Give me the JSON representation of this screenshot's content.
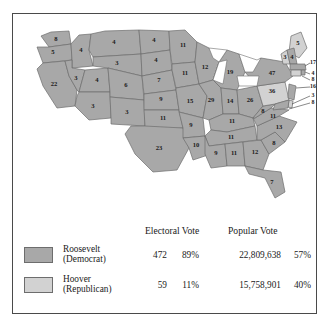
{
  "chart_data": {
    "type": "map",
    "colors": {
      "democrat_fill": "#a8a8a8",
      "republican_fill": "#d2d2d2",
      "water": "#ffffff",
      "stroke": "#6d6d6d",
      "frame": "#4a4a4a"
    },
    "legend_position": "bottom-left",
    "columns": [
      "",
      "Electoral Vote",
      "Popular Vote"
    ],
    "series": [
      {
        "name": "Roosevelt",
        "party": "(Democrat)",
        "swatch": "#a8a8a8",
        "electoral_votes": "472",
        "electoral_pct": "89%",
        "popular_votes": "22,809,638",
        "popular_pct": "57%"
      },
      {
        "name": "Hoover",
        "party": "(Republican)",
        "swatch": "#d2d2d2",
        "electoral_votes": "59",
        "electoral_pct": "11%",
        "popular_votes": "15,758,901",
        "popular_pct": "40%"
      }
    ],
    "states": [
      {
        "code": "WA",
        "value": "8",
        "winner": "Roosevelt"
      },
      {
        "code": "OR",
        "value": "5",
        "winner": "Roosevelt"
      },
      {
        "code": "CA",
        "value": "22",
        "winner": "Roosevelt"
      },
      {
        "code": "ID",
        "value": "4",
        "winner": "Roosevelt"
      },
      {
        "code": "NV",
        "value": "3",
        "winner": "Roosevelt"
      },
      {
        "code": "UT",
        "value": "4",
        "winner": "Roosevelt"
      },
      {
        "code": "AZ",
        "value": "3",
        "winner": "Roosevelt"
      },
      {
        "code": "MT",
        "value": "4",
        "winner": "Roosevelt"
      },
      {
        "code": "WY",
        "value": "3",
        "winner": "Roosevelt"
      },
      {
        "code": "CO",
        "value": "6",
        "winner": "Roosevelt"
      },
      {
        "code": "NM",
        "value": "3",
        "winner": "Roosevelt"
      },
      {
        "code": "ND",
        "value": "4",
        "winner": "Roosevelt"
      },
      {
        "code": "SD",
        "value": "4",
        "winner": "Roosevelt"
      },
      {
        "code": "NE",
        "value": "7",
        "winner": "Roosevelt"
      },
      {
        "code": "KS",
        "value": "9",
        "winner": "Roosevelt"
      },
      {
        "code": "OK",
        "value": "11",
        "winner": "Roosevelt"
      },
      {
        "code": "TX",
        "value": "23",
        "winner": "Roosevelt"
      },
      {
        "code": "MN",
        "value": "11",
        "winner": "Roosevelt"
      },
      {
        "code": "IA",
        "value": "11",
        "winner": "Roosevelt"
      },
      {
        "code": "MO",
        "value": "15",
        "winner": "Roosevelt"
      },
      {
        "code": "AR",
        "value": "9",
        "winner": "Roosevelt"
      },
      {
        "code": "LA",
        "value": "10",
        "winner": "Roosevelt"
      },
      {
        "code": "WI",
        "value": "12",
        "winner": "Roosevelt"
      },
      {
        "code": "MI",
        "value": "19",
        "winner": "Roosevelt"
      },
      {
        "code": "IL",
        "value": "29",
        "winner": "Roosevelt"
      },
      {
        "code": "IN",
        "value": "14",
        "winner": "Roosevelt"
      },
      {
        "code": "OH",
        "value": "26",
        "winner": "Roosevelt"
      },
      {
        "code": "KY",
        "value": "11",
        "winner": "Roosevelt"
      },
      {
        "code": "TN",
        "value": "11",
        "winner": "Roosevelt"
      },
      {
        "code": "MS",
        "value": "9",
        "winner": "Roosevelt"
      },
      {
        "code": "AL",
        "value": "11",
        "winner": "Roosevelt"
      },
      {
        "code": "GA",
        "value": "12",
        "winner": "Roosevelt"
      },
      {
        "code": "FL",
        "value": "7",
        "winner": "Roosevelt"
      },
      {
        "code": "SC",
        "value": "8",
        "winner": "Roosevelt"
      },
      {
        "code": "NC",
        "value": "13",
        "winner": "Roosevelt"
      },
      {
        "code": "VA",
        "value": "11",
        "winner": "Roosevelt"
      },
      {
        "code": "WV",
        "value": "8",
        "winner": "Roosevelt"
      },
      {
        "code": "PA",
        "value": "36",
        "winner": "Hoover"
      },
      {
        "code": "NY",
        "value": "47",
        "winner": "Roosevelt"
      },
      {
        "code": "ME",
        "value": "5",
        "winner": "Hoover"
      },
      {
        "code": "VT",
        "value": "3",
        "winner": "Hoover"
      },
      {
        "code": "NH",
        "value": "4",
        "winner": "Roosevelt"
      },
      {
        "code": "MA",
        "value": "17",
        "winner": "Roosevelt"
      },
      {
        "code": "RI",
        "value": "4",
        "winner": "Roosevelt"
      },
      {
        "code": "CT",
        "value": "8",
        "winner": "Hoover"
      },
      {
        "code": "NJ",
        "value": "16",
        "winner": "Roosevelt"
      },
      {
        "code": "DE",
        "value": "3",
        "winner": "Hoover"
      },
      {
        "code": "MD",
        "value": "8",
        "winner": "Roosevelt"
      }
    ]
  },
  "legend": {
    "header_electoral": "Electoral Vote",
    "header_popular": "Popular Vote",
    "rows": [
      {
        "name": "Roosevelt",
        "party": "(Democrat)",
        "electoral": "472",
        "electoral_pct": "89%",
        "popular": "22,809,638",
        "popular_pct": "57%"
      },
      {
        "name": "Hoover",
        "party": "(Republican)",
        "electoral": "59",
        "electoral_pct": "11%",
        "popular": "15,758,901",
        "popular_pct": "40%"
      }
    ]
  }
}
